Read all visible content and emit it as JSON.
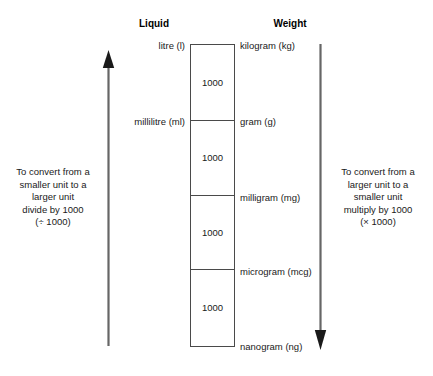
{
  "diagram": {
    "headings": {
      "liquid": "Liquid",
      "weight": "Weight"
    },
    "liquid_units": [
      {
        "id": "litre",
        "label": "litre (l)"
      },
      {
        "id": "millilitre",
        "label": "millilitre (ml)"
      }
    ],
    "weight_units": [
      {
        "id": "kilogram",
        "label": "kilogram (kg)"
      },
      {
        "id": "gram",
        "label": "gram (g)"
      },
      {
        "id": "milligram",
        "label": "milligram (mg)"
      },
      {
        "id": "microgram",
        "label": "microgram (mcg)"
      },
      {
        "id": "nanogram",
        "label": "nanogram (ng)"
      }
    ],
    "ladder_steps": [
      {
        "factor": "1000"
      },
      {
        "factor": "1000"
      },
      {
        "factor": "1000"
      },
      {
        "factor": "1000"
      }
    ],
    "instructions": {
      "left": "To convert from a\nsmaller unit to a\nlarger unit\ndivide by 1000\n(÷ 1000)",
      "right": "To convert from a\nlarger unit to a\nsmaller unit\nmultiply by 1000\n(× 1000)"
    },
    "arrows": {
      "left": {
        "name": "up-arrow-icon",
        "direction": "up"
      },
      "right": {
        "name": "down-arrow-icon",
        "direction": "down"
      }
    },
    "colors": {
      "line": "#4a4a4a",
      "text": "#1a1a1a",
      "arrow": "#555555",
      "background": "#ffffff"
    }
  }
}
